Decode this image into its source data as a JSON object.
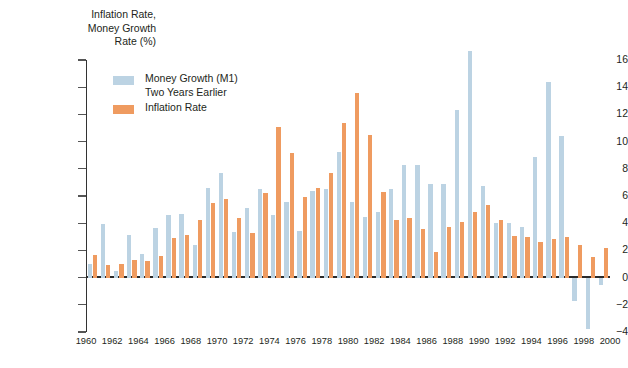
{
  "chart_data": {
    "type": "bar",
    "title": "",
    "ylabel": "Inflation Rate,\nMoney Growth\nRate (%)",
    "ylabel_lines": [
      "Inflation Rate,",
      "Money Growth",
      "Rate (%)"
    ],
    "xlabel": "",
    "ylim": [
      -4,
      16
    ],
    "yticks": [
      -4,
      -2,
      0,
      2,
      4,
      6,
      8,
      10,
      12,
      14,
      16
    ],
    "ytick_labels": [
      "−4",
      "−2",
      "0",
      "2",
      "4",
      "6",
      "8",
      "10",
      "12",
      "14",
      "16"
    ],
    "grid": false,
    "legend_position": "upper-left-inside",
    "x": [
      1960,
      1961,
      1962,
      1963,
      1964,
      1965,
      1966,
      1967,
      1968,
      1969,
      1970,
      1971,
      1972,
      1973,
      1974,
      1975,
      1976,
      1977,
      1978,
      1979,
      1980,
      1981,
      1982,
      1983,
      1984,
      1985,
      1986,
      1987,
      1988,
      1989,
      1990,
      1991,
      1992,
      1993,
      1994,
      1995,
      1996,
      1997,
      1998,
      1999
    ],
    "xtick_labels": [
      "1960",
      "1962",
      "1964",
      "1966",
      "1968",
      "1970",
      "1972",
      "1974",
      "1976",
      "1978",
      "1980",
      "1982",
      "1984",
      "1986",
      "1988",
      "1990",
      "1992",
      "1994",
      "1996",
      "1998",
      "2000"
    ],
    "xticks": [
      1960,
      1962,
      1964,
      1966,
      1968,
      1970,
      1972,
      1974,
      1976,
      1978,
      1980,
      1982,
      1984,
      1986,
      1988,
      1990,
      1992,
      1994,
      1996,
      1998,
      2000
    ],
    "series": [
      {
        "name": "Money Growth (M1)\nTwo Years Earlier",
        "name_lines": [
          "Money Growth (M1)",
          "Two Years Earlier"
        ],
        "color": "#bcd3e3",
        "values": [
          1.0,
          3.95,
          0.5,
          3.1,
          1.75,
          3.65,
          4.6,
          4.7,
          2.4,
          6.6,
          7.7,
          3.35,
          5.15,
          6.55,
          4.6,
          5.55,
          3.45,
          6.35,
          6.5,
          9.25,
          5.55,
          4.45,
          4.85,
          6.55,
          8.3,
          8.3,
          6.9,
          6.9,
          12.3,
          16.65,
          6.75,
          4.05,
          4.0,
          3.75,
          8.85,
          14.35,
          10.4,
          -1.7,
          -3.8,
          -0.55
        ]
      },
      {
        "name": "Inflation Rate",
        "color": "#ef9b60",
        "values": [
          1.65,
          0.95,
          1.0,
          1.3,
          1.25,
          1.6,
          2.9,
          3.1,
          4.2,
          5.5,
          5.75,
          4.4,
          3.25,
          6.25,
          11.05,
          9.15,
          5.9,
          6.6,
          7.7,
          11.4,
          13.6,
          10.45,
          6.3,
          4.2,
          4.35,
          3.55,
          1.85,
          3.7,
          4.1,
          4.85,
          5.35,
          4.25,
          3.05,
          3.0,
          2.6,
          2.85,
          2.95,
          2.4,
          1.55,
          2.2
        ]
      }
    ],
    "annotations": []
  },
  "colors": {
    "money_growth": "#bcd3e3",
    "inflation": "#ef9b60",
    "axis": "#2b2b2b",
    "text": "#231f20",
    "background": "#ffffff"
  }
}
